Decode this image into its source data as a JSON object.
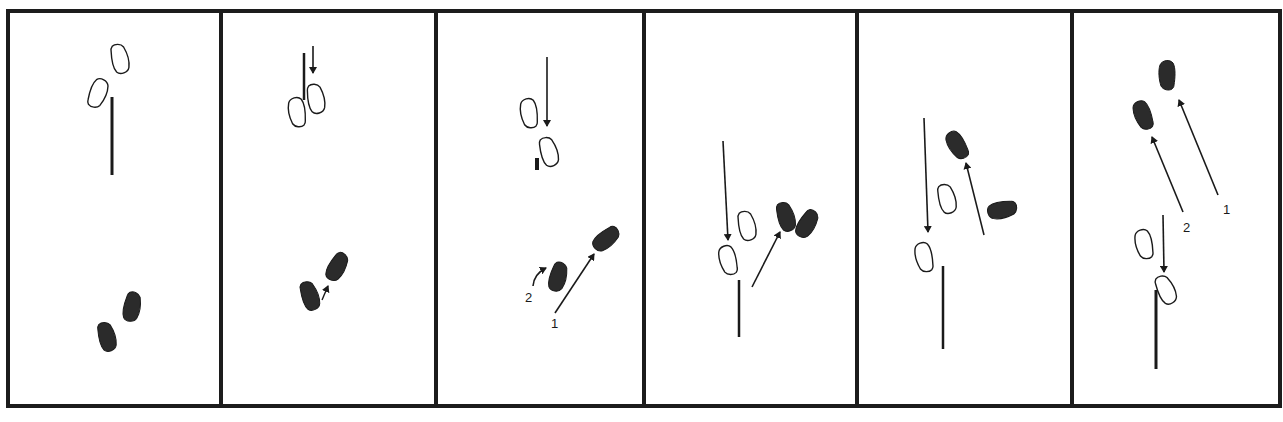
{
  "diagram": {
    "type": "sequence-of-panels",
    "panel_count": 6,
    "colors": {
      "ink": "#1a1a1a",
      "fill_dark": "#2b2b2b",
      "background": "#ffffff",
      "border": "#1c1c1c"
    },
    "panels": [
      {
        "index": 1,
        "labels": []
      },
      {
        "index": 2,
        "labels": []
      },
      {
        "index": 3,
        "labels": [
          "2",
          "1"
        ]
      },
      {
        "index": 4,
        "labels": []
      },
      {
        "index": 5,
        "labels": []
      },
      {
        "index": 6,
        "labels": [
          "2",
          "1"
        ]
      }
    ]
  }
}
